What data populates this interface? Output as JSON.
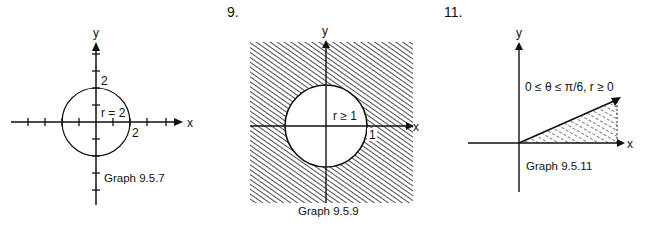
{
  "panels": [
    {
      "number": "",
      "caption": "Graph 9.5.7",
      "x_label": "x",
      "y_label": "y",
      "annotation": "r = 2",
      "x_tick_label": "2",
      "y_tick_label": "2",
      "description": "Circle of radius 2 centered at origin"
    },
    {
      "number": "9.",
      "caption": "Graph 9.5.9",
      "x_label": "x",
      "y_label": "y",
      "annotation": "r ≥ 1",
      "x_tick_label": "1",
      "description": "Shaded region outside unit circle"
    },
    {
      "number": "11.",
      "caption": "Graph 9.5.11",
      "x_label": "x",
      "y_label": "y",
      "annotation": "0 ≤ θ ≤ π/6, r ≥ 0",
      "description": "Shaded wedge between x-axis and ray at angle π/6"
    }
  ]
}
